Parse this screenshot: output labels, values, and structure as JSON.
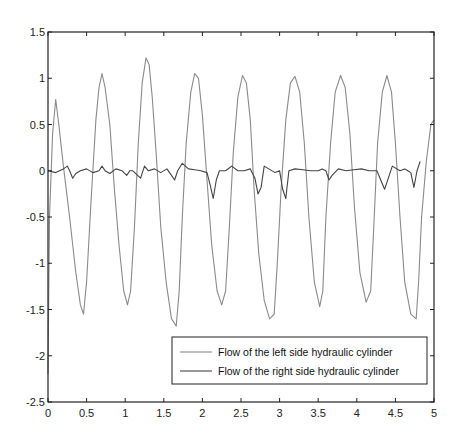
{
  "chart_data": {
    "type": "line",
    "title": "",
    "xlabel": "",
    "ylabel": "",
    "xlim": [
      0,
      5
    ],
    "ylim": [
      -2.5,
      1.5
    ],
    "xticks": [
      0,
      0.5,
      1,
      1.5,
      2,
      2.5,
      3,
      3.5,
      4,
      4.5,
      5
    ],
    "xtick_labels": [
      "0",
      "0.5",
      "1",
      "1.5",
      "2",
      "2.5",
      "3",
      "3.5",
      "4",
      "4.5",
      "5"
    ],
    "yticks": [
      1.5,
      1,
      0.5,
      0,
      -0.5,
      -1,
      -1.5,
      -2,
      -2.5
    ],
    "ytick_labels": [
      "1.5",
      "1",
      "0.5",
      "0",
      "-0.5",
      "-1",
      "-1.5",
      "-2",
      "-2.5"
    ],
    "grid": false,
    "legend_position": "lower right",
    "series": [
      {
        "name": "Flow of the left side hydraulic cylinder",
        "color": "#8a8a8a",
        "x": [
          0.0,
          0.02,
          0.06,
          0.1,
          0.14,
          0.2,
          0.28,
          0.36,
          0.42,
          0.46,
          0.5,
          0.56,
          0.62,
          0.66,
          0.7,
          0.74,
          0.8,
          0.86,
          0.92,
          0.98,
          1.03,
          1.07,
          1.12,
          1.17,
          1.22,
          1.27,
          1.31,
          1.35,
          1.4,
          1.46,
          1.53,
          1.6,
          1.66,
          1.7,
          1.74,
          1.79,
          1.85,
          1.9,
          1.95,
          2.0,
          2.06,
          2.12,
          2.19,
          2.25,
          2.3,
          2.35,
          2.4,
          2.46,
          2.52,
          2.57,
          2.62,
          2.67,
          2.73,
          2.8,
          2.87,
          2.93,
          2.97,
          3.02,
          3.08,
          3.14,
          3.2,
          3.26,
          3.32,
          3.38,
          3.45,
          3.52,
          3.56,
          3.6,
          3.66,
          3.72,
          3.79,
          3.85,
          3.91,
          3.97,
          4.04,
          4.12,
          4.18,
          4.22,
          4.27,
          4.33,
          4.39,
          4.45,
          4.5,
          4.56,
          4.62,
          4.7,
          4.77,
          4.8,
          4.84,
          4.9,
          4.96,
          5.0
        ],
        "y": [
          -2.2,
          -0.5,
          0.4,
          0.77,
          0.5,
          0.05,
          -0.5,
          -1.1,
          -1.45,
          -1.55,
          -1.2,
          -0.3,
          0.55,
          0.9,
          1.05,
          0.9,
          0.5,
          -0.2,
          -0.8,
          -1.3,
          -1.45,
          -1.3,
          -0.6,
          0.3,
          0.95,
          1.22,
          1.15,
          0.8,
          0.2,
          -0.6,
          -1.2,
          -1.6,
          -1.68,
          -1.3,
          -0.5,
          0.3,
          0.85,
          1.05,
          1.0,
          0.6,
          -0.1,
          -0.8,
          -1.3,
          -1.45,
          -1.3,
          -0.6,
          0.2,
          0.8,
          1.03,
          0.95,
          0.55,
          -0.2,
          -0.9,
          -1.4,
          -1.6,
          -1.55,
          -1.0,
          -0.2,
          0.55,
          0.95,
          1.02,
          0.85,
          0.3,
          -0.5,
          -1.2,
          -1.47,
          -1.3,
          -0.5,
          0.3,
          0.85,
          1.03,
          0.9,
          0.4,
          -0.4,
          -1.1,
          -1.42,
          -1.3,
          -0.6,
          0.3,
          0.85,
          1.03,
          0.85,
          0.3,
          -0.5,
          -1.2,
          -1.55,
          -1.6,
          -1.2,
          -0.5,
          0.1,
          0.5,
          0.55
        ]
      },
      {
        "name": "Flow of the right side hydraulic cylinder",
        "color": "#444444",
        "x": [
          0.0,
          0.1,
          0.2,
          0.25,
          0.28,
          0.32,
          0.36,
          0.42,
          0.5,
          0.58,
          0.66,
          0.7,
          0.74,
          0.8,
          0.88,
          0.96,
          1.02,
          1.06,
          1.1,
          1.16,
          1.2,
          1.25,
          1.3,
          1.38,
          1.46,
          1.54,
          1.6,
          1.64,
          1.68,
          1.74,
          1.82,
          1.9,
          1.98,
          2.06,
          2.1,
          2.14,
          2.18,
          2.22,
          2.3,
          2.38,
          2.46,
          2.54,
          2.62,
          2.68,
          2.72,
          2.76,
          2.8,
          2.86,
          2.94,
          3.0,
          3.04,
          3.08,
          3.12,
          3.2,
          3.3,
          3.4,
          3.5,
          3.55,
          3.6,
          3.64,
          3.68,
          3.76,
          3.86,
          3.96,
          4.06,
          4.16,
          4.22,
          4.26,
          4.3,
          4.36,
          4.46,
          4.56,
          4.62,
          4.66,
          4.7,
          4.74,
          4.78,
          4.82
        ],
        "y": [
          0.0,
          -0.02,
          0.02,
          0.05,
          0.0,
          -0.08,
          -0.03,
          0.0,
          0.02,
          -0.02,
          0.0,
          0.05,
          0.0,
          -0.03,
          0.02,
          0.0,
          -0.05,
          0.0,
          0.0,
          -0.05,
          -0.08,
          0.05,
          0.0,
          0.02,
          -0.02,
          0.02,
          -0.05,
          -0.1,
          0.0,
          0.08,
          0.02,
          0.01,
          0.0,
          -0.02,
          -0.15,
          -0.3,
          -0.1,
          0.0,
          0.0,
          0.05,
          0.0,
          0.0,
          0.02,
          -0.08,
          -0.25,
          -0.18,
          0.05,
          0.02,
          -0.02,
          0.0,
          -0.2,
          -0.3,
          0.0,
          0.02,
          0.01,
          0.0,
          0.0,
          0.02,
          0.0,
          -0.1,
          -0.05,
          0.02,
          0.0,
          0.01,
          0.02,
          0.0,
          0.0,
          0.0,
          -0.08,
          -0.2,
          0.05,
          0.0,
          0.02,
          0.0,
          -0.02,
          -0.18,
          0.0,
          0.1
        ]
      }
    ],
    "legend": {
      "entries": [
        {
          "label": "Flow of the left side hydraulic cylinder",
          "color": "#8a8a8a"
        },
        {
          "label": "Flow of the right side hydraulic cylinder",
          "color": "#444444"
        }
      ]
    }
  }
}
